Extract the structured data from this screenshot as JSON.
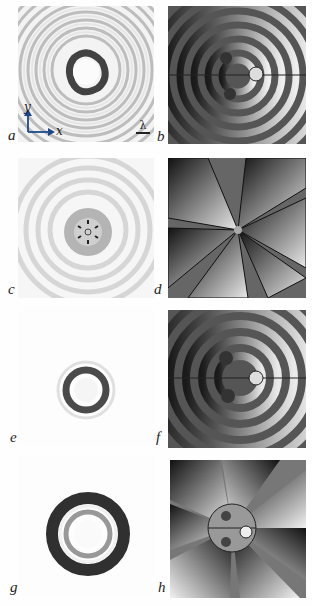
{
  "figure": {
    "panels": [
      {
        "id": "a",
        "label": "a",
        "kind": "intensity",
        "description": "Intensity with concentric rings and dark triangular core"
      },
      {
        "id": "b",
        "label": "b",
        "kind": "phase",
        "description": "Phase map with concentric spiral rings, 3 vortices"
      },
      {
        "id": "c",
        "label": "c",
        "kind": "intensity",
        "description": "Intensity with faint rings and small central flower vortex cluster"
      },
      {
        "id": "d",
        "label": "d",
        "kind": "phase",
        "description": "Phase map with 6 jagged spiral arms"
      },
      {
        "id": "e",
        "label": "e",
        "kind": "intensity",
        "description": "Small ring-shaped intensity"
      },
      {
        "id": "f",
        "label": "f",
        "kind": "phase",
        "description": "Phase map with concentric rings, 3 vortices"
      },
      {
        "id": "g",
        "label": "g",
        "kind": "intensity",
        "description": "Double ring intensity"
      },
      {
        "id": "h",
        "label": "h",
        "kind": "phase",
        "description": "Phase map with 6 radial sectors and central disc"
      }
    ],
    "axes_inset": {
      "x_label": "x",
      "y_label": "y"
    },
    "scale_bar": {
      "label": "λ"
    }
  }
}
